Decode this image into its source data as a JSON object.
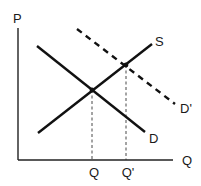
{
  "diagram": {
    "colors": {
      "background": "#ffffff",
      "line": "#111111",
      "text": "#1a1a1a"
    },
    "axes": {
      "y_label": "P",
      "x_label": "Q",
      "origin": [
        18,
        160
      ],
      "y_top": [
        18,
        28
      ],
      "x_right": [
        173,
        160
      ]
    },
    "curves": [
      {
        "name": "S",
        "label": "S",
        "style": "solid",
        "from": [
          38,
          133
        ],
        "to": [
          152,
          44
        ],
        "label_pos": [
          155,
          46
        ]
      },
      {
        "name": "D",
        "label": "D",
        "style": "solid",
        "from": [
          37,
          46
        ],
        "to": [
          145,
          132
        ],
        "label_pos": [
          149,
          143
        ]
      },
      {
        "name": "D'",
        "label": "D'",
        "style": "dashed",
        "from": [
          77,
          29
        ],
        "to": [
          175,
          104
        ],
        "label_pos": [
          180,
          113
        ]
      }
    ],
    "equilibria": [
      {
        "name": "original",
        "point": [
          92,
          90
        ],
        "quantity_label": "Q"
      },
      {
        "name": "new",
        "point": [
          126,
          65
        ],
        "quantity_label": "Q'"
      }
    ],
    "tick_labels": [
      {
        "text": "Q",
        "x": 94,
        "y": 177
      },
      {
        "text": "Q'",
        "x": 128,
        "y": 177
      }
    ],
    "axis_label_positions": {
      "P": [
        13,
        23
      ],
      "Q": [
        182,
        165
      ]
    }
  }
}
